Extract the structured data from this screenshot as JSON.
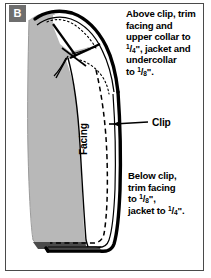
{
  "figure": {
    "panel_label": "B",
    "background_color": "#ffffff",
    "border_color": "#4a4a4a",
    "fabric_gray": "#b8b8b8",
    "ink_color": "#000000"
  },
  "callouts": {
    "top": {
      "lines": [
        "Above clip, trim",
        "facing and",
        "upper collar to",
        "1/4\", jacket and",
        "undercollar",
        "to 1/8\"."
      ],
      "text": "Above clip, trim facing and upper collar to 1/4\", jacket and undercollar to 1/8\"."
    },
    "bottom": {
      "lines": [
        "Below clip,",
        "trim facing",
        "to 1/8\",",
        "jacket to 1/4\"."
      ],
      "text": "Below clip, trim facing to 1/8\", jacket to 1/4\"."
    }
  },
  "labels": {
    "clip": "Clip",
    "facing": "Facing"
  },
  "fractions": {
    "quarter_num": "1",
    "quarter_den": "4",
    "eighth_num": "1",
    "eighth_den": "8",
    "inch_mark": "\""
  }
}
